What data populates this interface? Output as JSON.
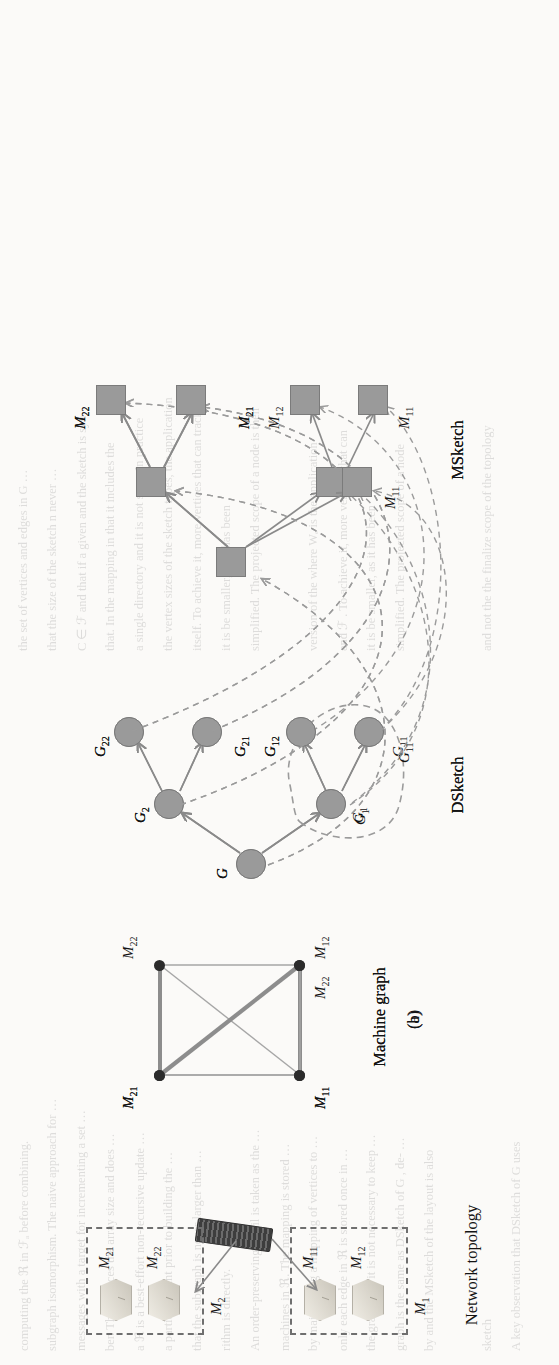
{
  "figure": {
    "orientation": "rotated-90-ccw",
    "panels": [
      {
        "letter": "(a)",
        "sections": [
          {
            "id": "network-topology",
            "caption": "Network topology",
            "groups": [
              {
                "label": "M₁",
                "label_plain": "M1",
                "machines": [
                  "M11",
                  "M12"
                ]
              },
              {
                "label": "M₂",
                "label_plain": "M2",
                "machines": [
                  "M21",
                  "M22"
                ]
              }
            ],
            "machine_labels": [
              "M11",
              "M12",
              "M21",
              "M22"
            ],
            "switch": "network-switch"
          },
          {
            "id": "machine-graph-a",
            "caption": "Machine graph",
            "nodes": [
              "M11",
              "M12",
              "M21",
              "M22"
            ],
            "edges": [
              {
                "from": "M11",
                "to": "M12",
                "weight": "thick"
              },
              {
                "from": "M21",
                "to": "M22",
                "weight": "thick"
              },
              {
                "from": "M11",
                "to": "M21",
                "weight": "thin"
              },
              {
                "from": "M12",
                "to": "M22",
                "weight": "thin"
              },
              {
                "from": "M11",
                "to": "M22",
                "weight": "thin"
              },
              {
                "from": "M12",
                "to": "M21",
                "weight": "thin"
              }
            ]
          },
          {
            "id": "dsketch-a",
            "caption": "DSketch",
            "nodes": [
              "G",
              "G1",
              "G2",
              "G11",
              "G12",
              "G21",
              "G22"
            ],
            "node_labels": [
              "G",
              "G₁",
              "G₂",
              "G₁₁",
              "G₁₂",
              "G₂₁",
              "G₂₂"
            ],
            "edges": [
              {
                "from": "G",
                "to": "G1"
              },
              {
                "from": "G",
                "to": "G2"
              },
              {
                "from": "G1",
                "to": "G11"
              },
              {
                "from": "G1",
                "to": "G12"
              },
              {
                "from": "G2",
                "to": "G21"
              },
              {
                "from": "G2",
                "to": "G22"
              }
            ],
            "grouping": null
          },
          {
            "id": "msketch-a",
            "caption": "MSketch",
            "nodes": [
              "root",
              "m1",
              "m2",
              "M11",
              "M12",
              "M21",
              "M22"
            ],
            "leaf_labels": [
              "M11",
              "M12",
              "M21",
              "M22"
            ],
            "edges": [
              {
                "from": "root",
                "to": "m1"
              },
              {
                "from": "root",
                "to": "m2"
              },
              {
                "from": "m1",
                "to": "M11"
              },
              {
                "from": "m1",
                "to": "M12"
              },
              {
                "from": "m2",
                "to": "M21"
              },
              {
                "from": "m2",
                "to": "M22"
              }
            ]
          }
        ],
        "mapping_note": "dashed arrows map DSketch nodes to MSketch nodes"
      },
      {
        "letter": "(b)",
        "sections": [
          {
            "id": "machine-graph-b",
            "caption": "Machine graph",
            "nodes": [
              "M11",
              "M21",
              "M22"
            ],
            "edges": [
              {
                "from": "M21",
                "to": "M22",
                "weight": "thick"
              },
              {
                "from": "M11",
                "to": "M21",
                "weight": "thin"
              },
              {
                "from": "M11",
                "to": "M22",
                "weight": "thin"
              }
            ]
          },
          {
            "id": "dsketch-b",
            "caption": "DSketch",
            "nodes": [
              "G",
              "G1",
              "G2",
              "G11",
              "G12",
              "G21",
              "G22"
            ],
            "node_labels": [
              "G",
              "G₁",
              "G₂",
              "G₁₁",
              "G₁₂",
              "G₂₁",
              "G₂₂"
            ],
            "edges": [
              {
                "from": "G",
                "to": "G1"
              },
              {
                "from": "G",
                "to": "G2"
              },
              {
                "from": "G1",
                "to": "G11"
              },
              {
                "from": "G1",
                "to": "G12"
              },
              {
                "from": "G2",
                "to": "G21"
              },
              {
                "from": "G2",
                "to": "G22"
              }
            ],
            "grouping": {
              "members": [
                "G1",
                "G11",
                "G12"
              ],
              "style": "dashed-outline"
            }
          },
          {
            "id": "msketch-b",
            "caption": "MSketch",
            "nodes": [
              "root",
              "m2",
              "M11",
              "M21",
              "M22"
            ],
            "leaf_labels": [
              "M11",
              "M21",
              "M22"
            ],
            "edges": [
              {
                "from": "root",
                "to": "M11"
              },
              {
                "from": "root",
                "to": "m2"
              },
              {
                "from": "m2",
                "to": "M21"
              },
              {
                "from": "m2",
                "to": "M22"
              }
            ]
          }
        ]
      }
    ],
    "labels": {
      "network_topology": "Network topology",
      "machine_graph": "Machine graph",
      "dsketch": "DSketch",
      "msketch": "MSketch",
      "panel_a": "(a)",
      "panel_b": "(b)",
      "M1": "M",
      "M2": "M",
      "M11": "M",
      "M12": "M",
      "M21": "M",
      "M22": "M",
      "G": "G",
      "sub_1": "1",
      "sub_2": "2",
      "sub_11": "11",
      "sub_12": "12",
      "sub_21": "21",
      "sub_22": "22"
    },
    "colors": {
      "node_fill": "#9a9a9a",
      "node_stroke": "#7b7b7b",
      "solid_edge": "#8a8a8a",
      "dashed_edge": "#9b9b9b",
      "graph_dot": "#2b2b2b",
      "thick_edge": "#8d8d8d",
      "thin_edge": "#a2a2a2",
      "text": "#141414",
      "page": "#fbfaf8"
    }
  },
  "background_text": {
    "lines": [
      "computing the  ℜ in ℱₐ before combining.",
      "subgraph isomorphism. The naive approach for  …",
      "messages with a target for incrementing a set …",
      "ber. This reduces the array size and does …",
      "a ℜ is a best-effort non-recursive update …",
      "a partition  point  prior to  building  the …",
      "that the subgraph is never larger than …",
      "rithm is directly.",
      "An order-preserving detail is taken as the …",
      "machines in  ℜ.  The   mapping  is  stored …",
      "by maintaining a mapping of vertices to …",
      "only each edge in  ℜ is stored once in …",
      "the graph, but it is not necessary to keep …",
      "graph is the same as  DSketch  of  G , de- …",
      "by and the MSketch of the layout is also",
      "",
      "sketch",
      "A key observation that DSketch of G uses",
      "the set of  vertices  and   edges  in  G …",
      "that the size of the sketch n never …",
      "C ∈ ℱ and that if a given and the sketch is syn-",
      "that. In the mapping in that it includes the",
      "a single directory and it is not seen. In practice",
      "the vertex sizes of the sketch types, the application",
      "itself. To achieve it, more vertices that can track",
      "it is be smaller, as it has been",
      "simplified. The projected scope of a node is then",
      "",
      "version of the  where  Wₑ  is  the  application",
      "and  ℱ .  To achieve it, more vertices  that  can",
      "it is be smaller, as it has been",
      "simplified.  The  projected  scope  of  a  node",
      "",
      "",
      "and not the  the finalize scope  of  the  topology"
    ]
  }
}
